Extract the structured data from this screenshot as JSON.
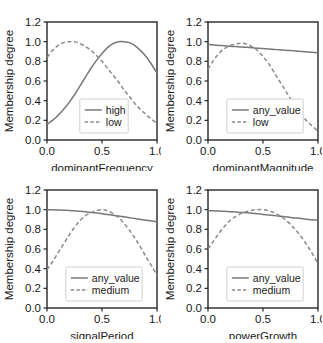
{
  "figure": {
    "title": "",
    "panel_count": 4,
    "shared_ylabel": "Membership degree",
    "yticks": [
      "0.0",
      "0.2",
      "0.4",
      "0.6",
      "0.8",
      "1.0",
      "1.2"
    ],
    "xticks": [
      "0.0",
      "0.5",
      "1.0"
    ]
  },
  "chart_data": [
    {
      "type": "line",
      "title": "",
      "xlabel": "dominantFrequency",
      "ylabel": "Membership degree",
      "xlim": [
        0.0,
        1.0
      ],
      "ylim": [
        0.0,
        1.2
      ],
      "xticks": [
        0.0,
        0.5,
        1.0
      ],
      "yticks": [
        0.0,
        0.2,
        0.4,
        0.6,
        0.8,
        1.0,
        1.2
      ],
      "grid": false,
      "legend_position": "lower-center",
      "x": [
        0.0,
        0.05,
        0.1,
        0.15,
        0.2,
        0.25,
        0.3,
        0.35,
        0.4,
        0.45,
        0.5,
        0.55,
        0.6,
        0.65,
        0.7,
        0.75,
        0.8,
        0.85,
        0.9,
        0.95,
        1.0
      ],
      "series": [
        {
          "name": "high",
          "style": "solid",
          "values": [
            0.16,
            0.2,
            0.25,
            0.31,
            0.38,
            0.46,
            0.55,
            0.64,
            0.73,
            0.81,
            0.88,
            0.94,
            0.98,
            1.0,
            1.0,
            0.99,
            0.96,
            0.91,
            0.85,
            0.77,
            0.68
          ]
        },
        {
          "name": "low",
          "style": "dashed",
          "values": [
            0.84,
            0.91,
            0.96,
            0.99,
            1.0,
            1.0,
            0.98,
            0.95,
            0.91,
            0.86,
            0.8,
            0.73,
            0.66,
            0.59,
            0.51,
            0.44,
            0.37,
            0.31,
            0.26,
            0.21,
            0.17
          ]
        }
      ]
    },
    {
      "type": "line",
      "title": "",
      "xlabel": "dominantMagnitude",
      "ylabel": "Membership degree",
      "xlim": [
        0.0,
        1.0
      ],
      "ylim": [
        0.0,
        1.2
      ],
      "xticks": [
        0.0,
        0.5,
        1.0
      ],
      "yticks": [
        0.0,
        0.2,
        0.4,
        0.6,
        0.8,
        1.0,
        1.2
      ],
      "grid": false,
      "legend_position": "lower-center",
      "x": [
        0.0,
        0.05,
        0.1,
        0.15,
        0.2,
        0.25,
        0.3,
        0.35,
        0.4,
        0.45,
        0.5,
        0.55,
        0.6,
        0.65,
        0.7,
        0.75,
        0.8,
        0.85,
        0.9,
        0.95,
        1.0
      ],
      "series": [
        {
          "name": "any_value",
          "style": "solid",
          "values": [
            0.97,
            0.966,
            0.962,
            0.958,
            0.954,
            0.95,
            0.946,
            0.942,
            0.938,
            0.934,
            0.93,
            0.925,
            0.921,
            0.917,
            0.913,
            0.909,
            0.905,
            0.9,
            0.896,
            0.892,
            0.885
          ]
        },
        {
          "name": "low",
          "style": "dashed",
          "values": [
            0.72,
            0.81,
            0.88,
            0.93,
            0.96,
            0.975,
            0.985,
            0.975,
            0.95,
            0.91,
            0.85,
            0.78,
            0.69,
            0.6,
            0.51,
            0.42,
            0.34,
            0.26,
            0.19,
            0.14,
            0.09
          ]
        }
      ]
    },
    {
      "type": "line",
      "title": "",
      "xlabel": "signalPeriod",
      "ylabel": "Membership degree",
      "xlim": [
        0.0,
        1.0
      ],
      "ylim": [
        0.0,
        1.2
      ],
      "xticks": [
        0.0,
        0.5,
        1.0
      ],
      "yticks": [
        0.0,
        0.2,
        0.4,
        0.6,
        0.8,
        1.0,
        1.2
      ],
      "grid": false,
      "legend_position": "lower-center",
      "x": [
        0.0,
        0.05,
        0.1,
        0.15,
        0.2,
        0.25,
        0.3,
        0.35,
        0.4,
        0.45,
        0.5,
        0.55,
        0.6,
        0.65,
        0.7,
        0.75,
        0.8,
        0.85,
        0.9,
        0.95,
        1.0
      ],
      "series": [
        {
          "name": "any_value",
          "style": "solid",
          "values": [
            1.0,
            0.999,
            0.997,
            0.995,
            0.992,
            0.988,
            0.983,
            0.978,
            0.972,
            0.966,
            0.959,
            0.951,
            0.943,
            0.935,
            0.927,
            0.918,
            0.91,
            0.901,
            0.893,
            0.885,
            0.877
          ]
        },
        {
          "name": "medium",
          "style": "dashed",
          "values": [
            0.39,
            0.47,
            0.56,
            0.65,
            0.74,
            0.82,
            0.89,
            0.94,
            0.97,
            0.99,
            1.0,
            0.99,
            0.96,
            0.92,
            0.86,
            0.79,
            0.71,
            0.62,
            0.52,
            0.43,
            0.33
          ]
        }
      ]
    },
    {
      "type": "line",
      "title": "",
      "xlabel": "powerGrowth",
      "ylabel": "Membership degree",
      "xlim": [
        0.0,
        1.0
      ],
      "ylim": [
        0.0,
        1.2
      ],
      "xticks": [
        0.0,
        0.5,
        1.0
      ],
      "yticks": [
        0.0,
        0.2,
        0.4,
        0.6,
        0.8,
        1.0,
        1.2
      ],
      "grid": false,
      "legend_position": "lower-center",
      "x": [
        0.0,
        0.05,
        0.1,
        0.15,
        0.2,
        0.25,
        0.3,
        0.35,
        0.4,
        0.45,
        0.5,
        0.55,
        0.6,
        0.65,
        0.7,
        0.75,
        0.8,
        0.85,
        0.9,
        0.95,
        1.0
      ],
      "series": [
        {
          "name": "any_value",
          "style": "solid",
          "values": [
            0.99,
            0.988,
            0.986,
            0.983,
            0.98,
            0.976,
            0.972,
            0.968,
            0.963,
            0.958,
            0.952,
            0.946,
            0.94,
            0.934,
            0.928,
            0.921,
            0.915,
            0.909,
            0.903,
            0.897,
            0.893
          ]
        },
        {
          "name": "medium",
          "style": "dashed",
          "values": [
            0.6,
            0.68,
            0.76,
            0.83,
            0.89,
            0.93,
            0.96,
            0.98,
            0.995,
            1.0,
            1.0,
            0.99,
            0.97,
            0.94,
            0.9,
            0.85,
            0.79,
            0.72,
            0.64,
            0.55,
            0.45
          ]
        }
      ]
    }
  ]
}
